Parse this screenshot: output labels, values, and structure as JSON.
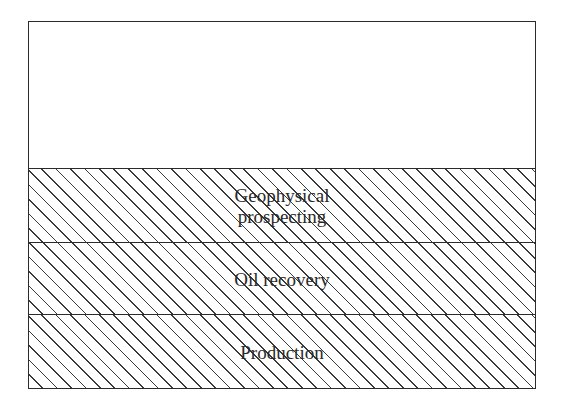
{
  "diagram": {
    "type": "layered-stack",
    "layers": [
      {
        "label": "",
        "fill": "none"
      },
      {
        "label_lines": [
          "Geophysical",
          "prospecting"
        ],
        "fill": "hatched"
      },
      {
        "label": "Oil recovery",
        "fill": "hatched"
      },
      {
        "label": "Production",
        "fill": "hatched"
      }
    ]
  }
}
